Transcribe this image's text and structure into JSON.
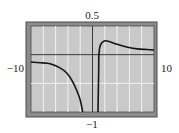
{
  "chart_data": {
    "type": "line",
    "title": "",
    "xlabel": "",
    "ylabel": "",
    "xlim": [
      -10,
      10
    ],
    "ylim": [
      -1,
      0.5
    ],
    "x_tick_step": 2,
    "y_tick_step": 0.5,
    "grid": true,
    "window_labels": {
      "ymax": "0.5",
      "ymin": "−1",
      "xmin": "−10",
      "xmax": "10"
    },
    "series": [
      {
        "name": "left-branch",
        "x": [
          -10,
          -8.5,
          -6.9,
          -5.3,
          -4.2,
          -3.4,
          -2.7,
          -2.0,
          -1.6
        ],
        "y": [
          -0.13,
          -0.14,
          -0.16,
          -0.23,
          -0.32,
          -0.44,
          -0.59,
          -0.79,
          -1.0
        ]
      },
      {
        "name": "right-branch",
        "x": [
          0.9,
          1.0,
          1.05,
          1.3,
          1.9,
          2.7,
          4.0,
          5.7,
          7.3,
          8.9,
          10
        ],
        "y": [
          -1.0,
          -0.27,
          0.02,
          0.17,
          0.24,
          0.23,
          0.18,
          0.13,
          0.1,
          0.09,
          0.08
        ]
      }
    ]
  },
  "colors": {
    "frame_band": "#8c8c8c",
    "frame_line": "#4a4a4a",
    "plot_bg": "#c9c9c9",
    "grid": "#f2f2f2",
    "axis": "#3a3a3a",
    "curve": "#141414"
  }
}
